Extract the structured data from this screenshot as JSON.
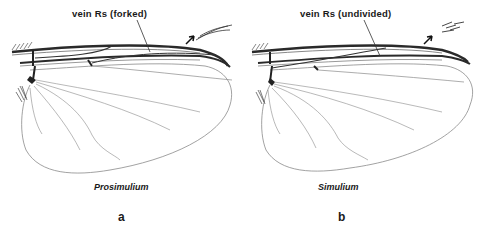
{
  "figure": {
    "panels": [
      {
        "id": "a",
        "callout_label": "vein Rs (forked)",
        "taxon_name": "Prosimulium",
        "panel_letter": "a"
      },
      {
        "id": "b",
        "callout_label": "vein Rs (undivided)",
        "taxon_name": "Simulium",
        "panel_letter": "b"
      }
    ],
    "colors": {
      "ink": "#1a1a1a",
      "vein": "#333333",
      "faint_vein": "#8a8a8a",
      "background": "#ffffff"
    }
  }
}
